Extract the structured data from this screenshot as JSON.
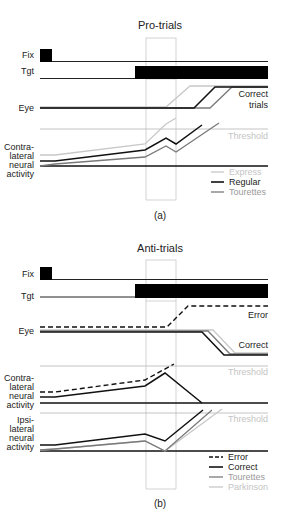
{
  "figure": {
    "panel_a": {
      "title": "Pro-trials",
      "caption": "(a)",
      "row_labels": {
        "fix": "Fix",
        "tgt": "Tgt",
        "eye": "Eye",
        "neural_1": "Contra-",
        "neural_2": "lateral",
        "neural_3": "neural",
        "neural_4": "activity"
      },
      "annotations": {
        "correct_1": "Correct",
        "correct_2": "trials",
        "threshold": "Threshold"
      },
      "legend": [
        {
          "label": "Express",
          "color": "#c8c8c8",
          "style": "solid"
        },
        {
          "label": "Regular",
          "color": "#111111",
          "style": "solid"
        },
        {
          "label": "Tourettes",
          "color": "#7a7a7a",
          "style": "solid"
        }
      ]
    },
    "panel_b": {
      "title": "Anti-trials",
      "caption": "(b)",
      "row_labels": {
        "fix": "Fix",
        "tgt": "Tgt",
        "eye": "Eye",
        "contra_1": "Contra-",
        "contra_2": "lateral",
        "contra_3": "neural",
        "contra_4": "activity",
        "ipsi_1": "Ipsi-",
        "ipsi_2": "lateral",
        "ipsi_3": "neural",
        "ipsi_4": "activity"
      },
      "annotations": {
        "error": "Error",
        "correct": "Correct",
        "threshold_1": "Threshold",
        "threshold_2": "Threshold"
      },
      "legend": [
        {
          "label": "Error",
          "color": "#111111",
          "style": "dashed"
        },
        {
          "label": "Correct",
          "color": "#111111",
          "style": "solid"
        },
        {
          "label": "Tourettes",
          "color": "#7a7a7a",
          "style": "solid"
        },
        {
          "label": "Parkinson",
          "color": "#c8c8c8",
          "style": "solid"
        }
      ]
    }
  }
}
